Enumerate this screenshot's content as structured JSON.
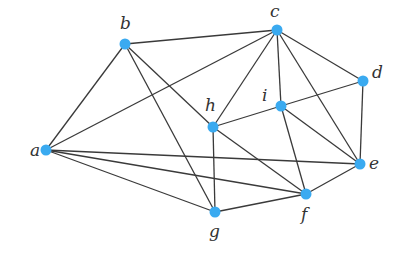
{
  "graph": {
    "node_color": "#3aaaf0",
    "edge_color": "#3a3a3a",
    "nodes": [
      {
        "id": "a",
        "label": "a"
      },
      {
        "id": "b",
        "label": "b"
      },
      {
        "id": "c",
        "label": "c"
      },
      {
        "id": "d",
        "label": "d"
      },
      {
        "id": "e",
        "label": "e"
      },
      {
        "id": "f",
        "label": "f"
      },
      {
        "id": "g",
        "label": "g"
      },
      {
        "id": "h",
        "label": "h"
      },
      {
        "id": "i",
        "label": "i"
      }
    ],
    "edges": [
      [
        "a",
        "b"
      ],
      [
        "a",
        "c"
      ],
      [
        "a",
        "e"
      ],
      [
        "a",
        "f"
      ],
      [
        "a",
        "g"
      ],
      [
        "b",
        "c"
      ],
      [
        "b",
        "h"
      ],
      [
        "b",
        "g"
      ],
      [
        "c",
        "h"
      ],
      [
        "c",
        "i"
      ],
      [
        "c",
        "d"
      ],
      [
        "c",
        "e"
      ],
      [
        "d",
        "i"
      ],
      [
        "d",
        "e"
      ],
      [
        "h",
        "i"
      ],
      [
        "h",
        "f"
      ],
      [
        "h",
        "g"
      ],
      [
        "i",
        "e"
      ],
      [
        "i",
        "f"
      ],
      [
        "e",
        "f"
      ],
      [
        "f",
        "g"
      ]
    ]
  }
}
